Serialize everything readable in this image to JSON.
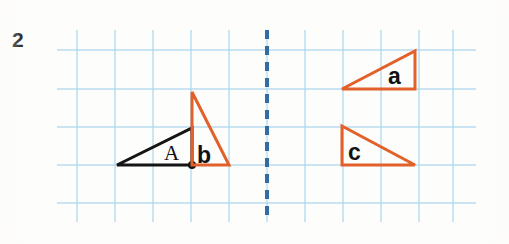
{
  "exercise": {
    "number": "2"
  },
  "colors": {
    "grid_line": "#a8d4ef",
    "mirror_line": "#2f6ca8",
    "shape_orange": "#e2602a",
    "shape_black": "#141414",
    "page_background": "#fdfdfc"
  },
  "grid": {
    "spacing": 38,
    "x_lines": [
      77,
      115,
      153,
      191,
      229,
      267,
      305,
      343,
      381,
      419,
      453
    ],
    "y_lines": [
      50,
      89,
      127,
      165,
      203
    ],
    "x_extent": [
      57,
      476
    ],
    "y_extent": [
      30,
      222
    ]
  },
  "mirror_line": {
    "name": "mirror-line",
    "orientation": "vertical",
    "x": 267,
    "y_start": 30,
    "y_end": 222,
    "dash_pattern": "9 7",
    "stroke_width": 4
  },
  "shapes": [
    {
      "id": "triangle-A",
      "label": "A",
      "label_style": "serif",
      "color": "#141414",
      "label_x": 164,
      "label_y": 160,
      "points": "117,165 192,128 192,165",
      "vertex_dot": {
        "cx": 192,
        "cy": 165,
        "r": 4
      }
    },
    {
      "id": "triangle-b",
      "label": "b",
      "label_style": "bold",
      "color": "#e2602a",
      "label_x": 197,
      "label_y": 163,
      "points": "192,92 229,165 192,165",
      "vertex_dot": null
    },
    {
      "id": "triangle-a",
      "label": "a",
      "label_style": "bold",
      "color": "#e2602a",
      "label_x": 388,
      "label_y": 84,
      "points": "342,89 415,51 415,89",
      "vertex_dot": null
    },
    {
      "id": "triangle-c",
      "label": "c",
      "label_style": "bold",
      "color": "#e2602a",
      "label_x": 348,
      "label_y": 160,
      "points": "342,126 415,165 342,165",
      "vertex_dot": null
    }
  ]
}
